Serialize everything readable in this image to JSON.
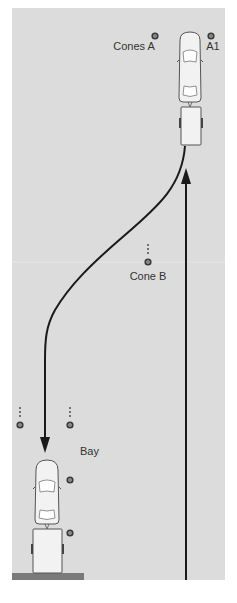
{
  "diagram": {
    "colors": {
      "background": "#ffffff",
      "field": "#dcdcdc",
      "line": "#1a1a1a",
      "vehicle_fill": "#f2f2f2",
      "vehicle_stroke": "#555555",
      "bay_bar": "#7a7a7a",
      "cone": "#3a3a3a"
    },
    "labels": {
      "cones_a": "Cones A",
      "a1": "A1",
      "cone_b": "Cone B",
      "bay": "Bay"
    },
    "cones": [
      {
        "id": "cones-a",
        "x": 155,
        "y": 36
      },
      {
        "id": "a1",
        "x": 211,
        "y": 36
      },
      {
        "id": "cone-b",
        "x": 148,
        "y": 262
      },
      {
        "id": "bay-left",
        "x": 20,
        "y": 425
      },
      {
        "id": "bay-right",
        "x": 70,
        "y": 425
      },
      {
        "id": "bay-side-upper",
        "x": 70,
        "y": 480
      },
      {
        "id": "bay-side-lower",
        "x": 70,
        "y": 533
      }
    ],
    "paths": {
      "reverse_route": "reverse curve from start position past Cone B into Bay",
      "forward_route": "straight forward path up to Cones A"
    }
  }
}
